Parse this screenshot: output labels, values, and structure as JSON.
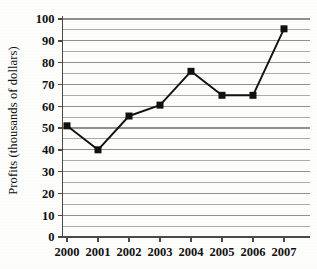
{
  "chart_data": {
    "type": "line",
    "title": "",
    "xlabel": "",
    "ylabel": "Profits (thousands of dollars)",
    "categories": [
      "2000",
      "2001",
      "2002",
      "2003",
      "2004",
      "2005",
      "2006",
      "2007"
    ],
    "values": [
      51,
      40,
      55.5,
      60.5,
      76,
      65,
      65,
      95.5
    ],
    "series": [
      {
        "name": "Profits",
        "values": [
          51,
          40,
          55.5,
          60.5,
          76,
          65,
          65,
          95.5
        ]
      }
    ],
    "ylim": [
      0,
      100
    ],
    "ytick_labels": [
      "0",
      "10",
      "20",
      "30",
      "40",
      "50",
      "60",
      "70",
      "80",
      "90",
      "100"
    ],
    "ytick_values": [
      0,
      10,
      20,
      30,
      40,
      50,
      60,
      70,
      80,
      90,
      100
    ],
    "y_major_step": 10,
    "y_minor_step": 5,
    "grid": true,
    "grid_axis": "y",
    "legend": false,
    "legend_position": "none",
    "marker": "square",
    "line_color": "#111111",
    "marker_color": "#111111",
    "grid_color": "#8a8a8a",
    "axis_color": "#555555",
    "background_color": "#fdfdfc"
  }
}
